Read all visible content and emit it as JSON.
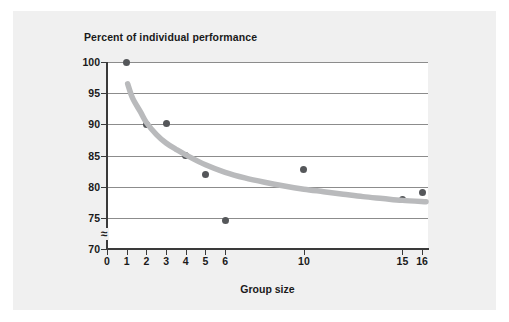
{
  "chart_data": {
    "type": "scatter",
    "title": "Percent of individual performance",
    "xlabel": "Group size",
    "ylabel": "",
    "xlim": [
      0,
      16.3
    ],
    "ylim": [
      70,
      100
    ],
    "grid": true,
    "legend": "none",
    "x_ticks": [
      0,
      1,
      2,
      3,
      4,
      5,
      6,
      10,
      15,
      16
    ],
    "x_tick_labels": [
      "0",
      "1",
      "2",
      "3",
      "4",
      "5",
      "6",
      "10",
      "15",
      "16"
    ],
    "y_ticks": [
      70,
      75,
      80,
      85,
      90,
      95,
      100
    ],
    "y_tick_labels": [
      "70",
      "75",
      "80",
      "85",
      "90",
      "95",
      "100"
    ],
    "y_axis_break": true,
    "y_axis_break_symbol": "≈",
    "point_color": "#55575a",
    "trend_color": "#b9babc",
    "grid_color": "#8c8c8c",
    "panel_color": "#f0f0f0",
    "plot_background": "#ffffff",
    "series": [
      {
        "name": "Observed group performance",
        "points": [
          {
            "x": 1,
            "y": 100
          },
          {
            "x": 2,
            "y": 90
          },
          {
            "x": 3,
            "y": 90.2
          },
          {
            "x": 4,
            "y": 85
          },
          {
            "x": 5,
            "y": 82
          },
          {
            "x": 6,
            "y": 74.5
          },
          {
            "x": 10,
            "y": 82.7
          },
          {
            "x": 15,
            "y": 78
          },
          {
            "x": 16,
            "y": 79
          }
        ]
      }
    ],
    "trend_curve": {
      "name": "Fitted decline curve",
      "points": [
        {
          "x": 1.05,
          "y": 96.5
        },
        {
          "x": 1.3,
          "y": 94.2
        },
        {
          "x": 1.7,
          "y": 92.0
        },
        {
          "x": 2.0,
          "y": 90.3
        },
        {
          "x": 2.5,
          "y": 88.4
        },
        {
          "x": 3.0,
          "y": 87.0
        },
        {
          "x": 3.5,
          "y": 86.0
        },
        {
          "x": 4.0,
          "y": 85.1
        },
        {
          "x": 5.0,
          "y": 83.5
        },
        {
          "x": 6.0,
          "y": 82.3
        },
        {
          "x": 7.0,
          "y": 81.4
        },
        {
          "x": 8.0,
          "y": 80.7
        },
        {
          "x": 9.0,
          "y": 80.1
        },
        {
          "x": 10.0,
          "y": 79.6
        },
        {
          "x": 11.0,
          "y": 79.2
        },
        {
          "x": 12.0,
          "y": 78.8
        },
        {
          "x": 13.0,
          "y": 78.4
        },
        {
          "x": 14.0,
          "y": 78.1
        },
        {
          "x": 15.0,
          "y": 77.8
        },
        {
          "x": 16.2,
          "y": 77.6
        }
      ]
    }
  }
}
